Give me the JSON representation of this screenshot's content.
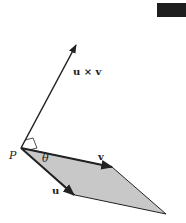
{
  "diagram": {
    "labels": {
      "point": "P",
      "cross": "u × v",
      "v": "v",
      "u": "u",
      "angle": "θ"
    },
    "colors": {
      "parallelogram_fill": "#c8c8c8",
      "stroke": "#222222",
      "corner_badge": "#1e1e1e"
    },
    "points": {
      "P": [
        21,
        148
      ],
      "cross_tip": [
        76,
        45
      ],
      "v_tip": [
        112,
        167
      ],
      "u_tip": [
        74,
        195
      ],
      "far": [
        166,
        214
      ]
    }
  }
}
